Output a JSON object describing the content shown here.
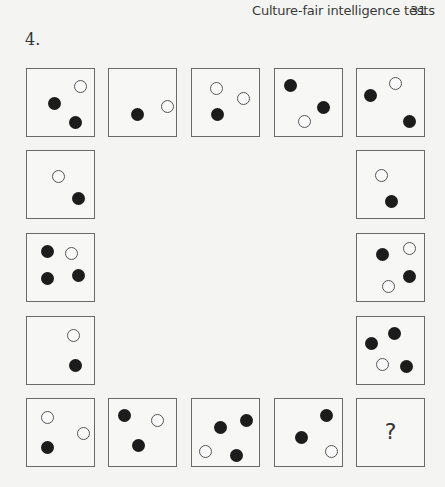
{
  "running_head": {
    "title": "Culture-fair intelligence tests",
    "page_number": "31"
  },
  "question": {
    "number": "4.",
    "missing_symbol": "?"
  },
  "cells": [
    {
      "id": "r1c1",
      "x": 26,
      "y": 68,
      "dots": [
        {
          "t": "white",
          "x": 53,
          "y": 17
        },
        {
          "t": "black",
          "x": 27,
          "y": 34
        },
        {
          "t": "black",
          "x": 48,
          "y": 53
        }
      ]
    },
    {
      "id": "r1c2",
      "x": 108,
      "y": 68,
      "dots": [
        {
          "t": "black",
          "x": 28,
          "y": 45
        },
        {
          "t": "white",
          "x": 58,
          "y": 37
        }
      ]
    },
    {
      "id": "r1c3",
      "x": 191,
      "y": 68,
      "dots": [
        {
          "t": "white",
          "x": 24,
          "y": 19
        },
        {
          "t": "white",
          "x": 51,
          "y": 29
        },
        {
          "t": "black",
          "x": 25,
          "y": 45
        }
      ]
    },
    {
      "id": "r1c4",
      "x": 274,
      "y": 68,
      "dots": [
        {
          "t": "black",
          "x": 15,
          "y": 16
        },
        {
          "t": "black",
          "x": 48,
          "y": 38
        },
        {
          "t": "white",
          "x": 29,
          "y": 52
        }
      ]
    },
    {
      "id": "r1c5",
      "x": 356,
      "y": 68,
      "dots": [
        {
          "t": "black",
          "x": 13,
          "y": 26
        },
        {
          "t": "white",
          "x": 38,
          "y": 14
        },
        {
          "t": "black",
          "x": 52,
          "y": 52
        }
      ]
    },
    {
      "id": "r2c1",
      "x": 26,
      "y": 150,
      "dots": [
        {
          "t": "white",
          "x": 31,
          "y": 25
        },
        {
          "t": "black",
          "x": 51,
          "y": 47
        }
      ]
    },
    {
      "id": "r2c5",
      "x": 356,
      "y": 150,
      "dots": [
        {
          "t": "white",
          "x": 24,
          "y": 24
        },
        {
          "t": "black",
          "x": 34,
          "y": 50
        }
      ]
    },
    {
      "id": "r3c1",
      "x": 26,
      "y": 233,
      "dots": [
        {
          "t": "black",
          "x": 20,
          "y": 17
        },
        {
          "t": "white",
          "x": 44,
          "y": 19
        },
        {
          "t": "black",
          "x": 20,
          "y": 44
        },
        {
          "t": "black",
          "x": 51,
          "y": 41
        }
      ]
    },
    {
      "id": "r3c5",
      "x": 356,
      "y": 233,
      "dots": [
        {
          "t": "black",
          "x": 25,
          "y": 20
        },
        {
          "t": "white",
          "x": 52,
          "y": 14
        },
        {
          "t": "black",
          "x": 52,
          "y": 42
        },
        {
          "t": "white",
          "x": 31,
          "y": 52
        }
      ]
    },
    {
      "id": "r4c1",
      "x": 26,
      "y": 316,
      "dots": [
        {
          "t": "white",
          "x": 46,
          "y": 18
        },
        {
          "t": "black",
          "x": 48,
          "y": 48
        }
      ]
    },
    {
      "id": "r4c5",
      "x": 356,
      "y": 316,
      "dots": [
        {
          "t": "black",
          "x": 14,
          "y": 26
        },
        {
          "t": "black",
          "x": 37,
          "y": 16
        },
        {
          "t": "white",
          "x": 25,
          "y": 47
        },
        {
          "t": "black",
          "x": 49,
          "y": 49
        }
      ]
    },
    {
      "id": "r5c1",
      "x": 26,
      "y": 398,
      "dots": [
        {
          "t": "white",
          "x": 20,
          "y": 18
        },
        {
          "t": "white",
          "x": 56,
          "y": 34
        },
        {
          "t": "black",
          "x": 20,
          "y": 48
        }
      ]
    },
    {
      "id": "r5c2",
      "x": 108,
      "y": 398,
      "dots": [
        {
          "t": "black",
          "x": 15,
          "y": 16
        },
        {
          "t": "white",
          "x": 48,
          "y": 21
        },
        {
          "t": "black",
          "x": 29,
          "y": 46
        }
      ]
    },
    {
      "id": "r5c3",
      "x": 191,
      "y": 398,
      "dots": [
        {
          "t": "black",
          "x": 28,
          "y": 28
        },
        {
          "t": "black",
          "x": 54,
          "y": 21
        },
        {
          "t": "white",
          "x": 13,
          "y": 52
        },
        {
          "t": "black",
          "x": 44,
          "y": 56
        }
      ]
    },
    {
      "id": "r5c4",
      "x": 274,
      "y": 398,
      "dots": [
        {
          "t": "black",
          "x": 51,
          "y": 16
        },
        {
          "t": "black",
          "x": 26,
          "y": 38
        },
        {
          "t": "white",
          "x": 56,
          "y": 52
        }
      ]
    },
    {
      "id": "r5c5",
      "x": 356,
      "y": 398,
      "dots": [],
      "missing": true
    }
  ],
  "colors": {
    "page": "#f4f4f2",
    "border": "#6a6a6a",
    "black_dot": "#1c1c1c",
    "white_dot_stroke": "#555555"
  }
}
